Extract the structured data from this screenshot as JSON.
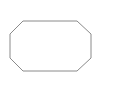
{
  "canvas": {
    "width": 114,
    "height": 87,
    "background": "#ffffff"
  },
  "shape": {
    "type": "octagon",
    "stroke": "#8a8a8a",
    "fill": "#ffffff",
    "stroke_width": 1,
    "points": "23,21 77,21 91,34 91,58 77,71 23,71 10,58 10,34"
  }
}
